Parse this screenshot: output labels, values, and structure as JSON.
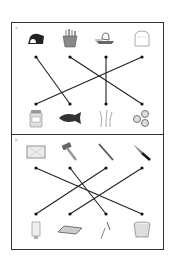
{
  "worksheet": {
    "title": "Matching worksheet",
    "sections": [
      {
        "id": "A",
        "label": "a",
        "top_items": [
          {
            "name": "bread-loaf",
            "x": 36
          },
          {
            "name": "fries",
            "x": 70
          },
          {
            "name": "butter-dish",
            "x": 106
          },
          {
            "name": "bread-slice",
            "x": 142
          }
        ],
        "bottom_items": [
          {
            "name": "jar",
            "x": 36
          },
          {
            "name": "fish",
            "x": 70
          },
          {
            "name": "wheat",
            "x": 106
          },
          {
            "name": "cookies",
            "x": 142
          }
        ],
        "dot_y_top": 57,
        "dot_y_bottom": 104,
        "connections": [
          [
            0,
            1
          ],
          [
            1,
            3
          ],
          [
            2,
            2
          ],
          [
            3,
            0
          ]
        ]
      },
      {
        "id": "B",
        "label": "b",
        "top_items": [
          {
            "name": "baking-tray",
            "x": 36
          },
          {
            "name": "hammer",
            "x": 70
          },
          {
            "name": "file-tool",
            "x": 106
          },
          {
            "name": "knife",
            "x": 142
          }
        ],
        "bottom_items": [
          {
            "name": "tube",
            "x": 36
          },
          {
            "name": "board",
            "x": 70
          },
          {
            "name": "nails",
            "x": 106
          },
          {
            "name": "bucket",
            "x": 142
          }
        ],
        "dot_y_top": 168,
        "dot_y_bottom": 214,
        "connections": [
          [
            0,
            3
          ],
          [
            1,
            2
          ],
          [
            2,
            0
          ],
          [
            3,
            1
          ]
        ]
      }
    ]
  }
}
